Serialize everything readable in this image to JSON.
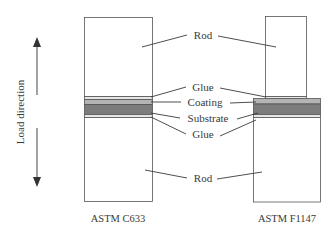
{
  "diagram": {
    "axis_label": "Load direction",
    "arrow_icon": "double-headed-vertical-arrow",
    "colors": {
      "rod_fill": "#ffffff",
      "outline": "#555555",
      "glue": "#e6e6e6",
      "coating": "#b4b4b4",
      "substrate": "#7c7c7c",
      "leader_line": "#3a3a3a"
    },
    "labels": {
      "rod_top": "Rod",
      "glue_top": "Glue",
      "coating": "Coating",
      "substrate": "Substrate",
      "glue_bottom": "Glue",
      "rod_bottom": "Rod"
    },
    "specimens": [
      {
        "name": "ASTM C633"
      },
      {
        "name": "ASTM F1147"
      }
    ]
  }
}
